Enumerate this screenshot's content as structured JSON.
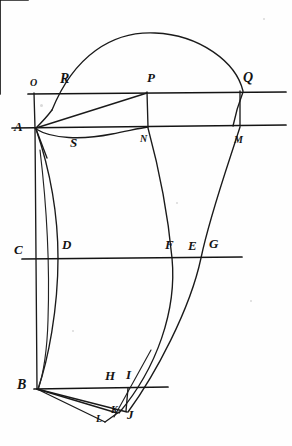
{
  "figure": {
    "ink_color": "#1a1a1a",
    "paper_color": "#fefefe",
    "width": 292,
    "height": 446
  },
  "points": [
    {
      "id": "O",
      "label": "O",
      "x": 30,
      "y": 78,
      "style": "small"
    },
    {
      "id": "R",
      "label": "R",
      "x": 60,
      "y": 72,
      "style": "script"
    },
    {
      "id": "P",
      "label": "P",
      "x": 147,
      "y": 71,
      "style": "normal"
    },
    {
      "id": "Q",
      "label": "Q",
      "x": 243,
      "y": 71,
      "style": "script"
    },
    {
      "id": "A",
      "label": "A",
      "x": 14,
      "y": 120,
      "style": "normal"
    },
    {
      "id": "S",
      "label": "S",
      "x": 70,
      "y": 136,
      "style": "normal"
    },
    {
      "id": "N",
      "label": "N",
      "x": 140,
      "y": 134,
      "style": "small"
    },
    {
      "id": "M",
      "label": "M",
      "x": 234,
      "y": 135,
      "style": "small"
    },
    {
      "id": "C",
      "label": "C",
      "x": 14,
      "y": 243,
      "style": "normal"
    },
    {
      "id": "D",
      "label": "D",
      "x": 62,
      "y": 238,
      "style": "normal"
    },
    {
      "id": "F",
      "label": "F",
      "x": 165,
      "y": 238,
      "style": "normal"
    },
    {
      "id": "E",
      "label": "E",
      "x": 188,
      "y": 239,
      "style": "normal"
    },
    {
      "id": "G",
      "label": "G",
      "x": 209,
      "y": 237,
      "style": "normal"
    },
    {
      "id": "B",
      "label": "B",
      "x": 17,
      "y": 378,
      "style": "script"
    },
    {
      "id": "H",
      "label": "H",
      "x": 105,
      "y": 369,
      "style": "normal"
    },
    {
      "id": "I",
      "label": "I",
      "x": 126,
      "y": 368,
      "style": "normal"
    },
    {
      "id": "K",
      "label": "K",
      "x": 111,
      "y": 405,
      "style": "small"
    },
    {
      "id": "J",
      "label": "J",
      "x": 127,
      "y": 408,
      "style": "normal"
    },
    {
      "id": "L",
      "label": "L",
      "x": 96,
      "y": 414,
      "style": "small"
    }
  ],
  "horizontal_lines": [
    {
      "name": "line-O-Q",
      "x1": 28,
      "y1": 94,
      "x2": 286,
      "y2": 92
    },
    {
      "name": "line-A-M",
      "x1": 12,
      "y1": 128,
      "x2": 286,
      "y2": 125
    },
    {
      "name": "line-C-G",
      "x1": 22,
      "y1": 259,
      "x2": 242,
      "y2": 257
    },
    {
      "name": "line-B-I",
      "x1": 34,
      "y1": 389,
      "x2": 168,
      "y2": 387
    }
  ],
  "vertical_lines": [
    {
      "name": "line-O-A",
      "x1": 34,
      "y1": 93,
      "x2": 35,
      "y2": 128
    },
    {
      "name": "line-A-B",
      "x1": 35,
      "y1": 128,
      "x2": 37,
      "y2": 389
    },
    {
      "name": "line-P-N",
      "x1": 147,
      "y1": 92,
      "x2": 148,
      "y2": 127
    },
    {
      "name": "line-Q-M",
      "x1": 240,
      "y1": 91,
      "x2": 240,
      "y2": 126
    },
    {
      "name": "line-I-J",
      "x1": 128,
      "y1": 388,
      "x2": 126,
      "y2": 411
    }
  ],
  "chords": [
    {
      "name": "chord-A-P",
      "x1": 36,
      "y1": 128,
      "x2": 147,
      "y2": 93
    },
    {
      "name": "chord-B-L",
      "x1": 37,
      "y1": 389,
      "x2": 105,
      "y2": 422
    },
    {
      "name": "chord-B-J",
      "x1": 37,
      "y1": 389,
      "x2": 127,
      "y2": 412
    },
    {
      "name": "chord-B-K",
      "x1": 37,
      "y1": 389,
      "x2": 117,
      "y2": 413
    },
    {
      "name": "chord-L-K",
      "x1": 105,
      "y1": 422,
      "x2": 119,
      "y2": 412
    },
    {
      "name": "chord-A-down",
      "x1": 36,
      "y1": 129,
      "x2": 47,
      "y2": 158
    }
  ],
  "curves": [
    {
      "name": "arc-R-apex-Q",
      "d": "M 52 110 C 74 56, 112 31, 155 33 C 200 35, 236 62, 243 91"
    },
    {
      "name": "curve-R-down-to-A",
      "d": "M 52 110 C 46 118, 40 124, 36 128"
    },
    {
      "name": "curve-A-S-N",
      "d": "M 36 129 C 52 139, 82 140, 112 134 C 128 131, 140 128, 148 127"
    },
    {
      "name": "curve-A-D-B",
      "d": "M 36 129 C 50 170, 58 215, 58 258 C 58 310, 48 360, 38 389"
    },
    {
      "name": "curve-left-inner-B",
      "d": "M 40 150 C 46 200, 50 260, 48 320 C 47 355, 42 378, 38 390"
    },
    {
      "name": "curve-N-F-K",
      "d": "M 148 128 C 158 165, 168 215, 172 258 C 177 310, 157 368, 119 413"
    },
    {
      "name": "curve-M-G-J",
      "d": "M 240 127 C 228 165, 210 215, 201 258 C 190 310, 155 375, 128 412"
    },
    {
      "name": "curve-Q-outer-down",
      "d": "M 243 92 C 238 105, 235 116, 233 126"
    },
    {
      "name": "curve-H-tail",
      "d": "M 151 350 C 140 370, 128 392, 114 417"
    }
  ],
  "specks": [
    {
      "x": 263,
      "y": 18,
      "d": 2
    },
    {
      "x": 40,
      "y": 104,
      "d": 3
    },
    {
      "x": 176,
      "y": 202,
      "d": 2
    },
    {
      "x": 72,
      "y": 330,
      "d": 2
    },
    {
      "x": 250,
      "y": 300,
      "d": 2
    }
  ]
}
